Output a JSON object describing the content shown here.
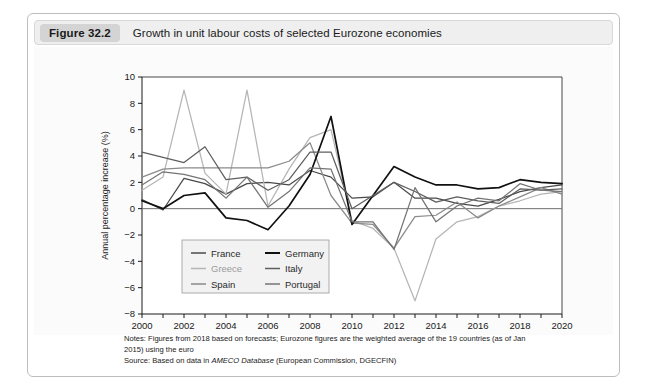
{
  "figure": {
    "number": "Figure 32.2",
    "title": "Growth in unit labour costs of selected Eurozone economies"
  },
  "notes": {
    "line1": "Notes: Figures from 2018 based on forecasts; Eurozone figures are the weighted average of the 19 countries (as of Jan",
    "line2": "2015) using the euro",
    "source_prefix": "Source: Based on data in ",
    "source_italic": "AMECO Database",
    "source_suffix": " (European Commission, DGECFIN)"
  },
  "chart_data": {
    "type": "line",
    "title": "Growth in unit labour costs of selected Eurozone economies",
    "xlabel": "",
    "ylabel": "Annual percentage increase (%)",
    "xlim": [
      2000,
      2020
    ],
    "ylim": [
      -8,
      10
    ],
    "ytick_step": 2,
    "yticks": [
      -8,
      -6,
      -4,
      -2,
      0,
      2,
      4,
      6,
      8,
      10
    ],
    "xticks": [
      2000,
      2001,
      2002,
      2003,
      2004,
      2005,
      2006,
      2007,
      2008,
      2009,
      2010,
      2011,
      2012,
      2013,
      2014,
      2015,
      2016,
      2017,
      2018,
      2019,
      2020
    ],
    "xtick_labels": [
      "2000",
      "",
      "2002",
      "",
      "2004",
      "",
      "2006",
      "",
      "2008",
      "",
      "2010",
      "",
      "2012",
      "",
      "2014",
      "",
      "2016",
      "",
      "2018",
      "",
      "2020"
    ],
    "grid": false,
    "zero_line": true,
    "legend_position": "lower-left-inside",
    "x": [
      2000,
      2001,
      2002,
      2003,
      2004,
      2005,
      2006,
      2007,
      2008,
      2009,
      2010,
      2011,
      2012,
      2013,
      2014,
      2015,
      2016,
      2017,
      2018,
      2019,
      2020
    ],
    "series": [
      {
        "name": "France",
        "color": "#4a4a4a",
        "values": [
          0.7,
          -0.1,
          2.3,
          1.9,
          1.1,
          1.9,
          2.0,
          1.8,
          2.9,
          2.4,
          0.8,
          0.9,
          2.0,
          0.8,
          0.8,
          0.4,
          0.2,
          0.7,
          1.3,
          1.6,
          1.8
        ]
      },
      {
        "name": "Greece",
        "color": "#b5b5b5",
        "values": [
          1.4,
          2.4,
          9.0,
          2.7,
          1.1,
          9.0,
          0.2,
          3.0,
          5.4,
          6.0,
          -0.9,
          -1.5,
          -3.0,
          -7.0,
          -2.3,
          -1.0,
          -0.6,
          0.2,
          0.6,
          1.1,
          1.3
        ]
      },
      {
        "name": "Spain",
        "color": "#8a8a8a",
        "values": [
          2.4,
          3.0,
          3.1,
          3.1,
          3.1,
          3.1,
          3.1,
          3.6,
          5.0,
          1.0,
          -1.1,
          -1.2,
          -3.0,
          -0.6,
          -0.5,
          0.5,
          -0.7,
          0.2,
          0.9,
          1.6,
          1.1
        ]
      },
      {
        "name": "Germany",
        "color": "#111111",
        "values": [
          0.6,
          0.0,
          1.0,
          1.2,
          -0.7,
          -0.9,
          -1.6,
          0.2,
          2.6,
          7.0,
          -1.2,
          1.0,
          3.2,
          2.4,
          1.8,
          1.8,
          1.5,
          1.6,
          2.2,
          2.0,
          1.9
        ]
      },
      {
        "name": "Italy",
        "color": "#5e5e5e",
        "values": [
          4.3,
          3.9,
          3.5,
          4.7,
          2.2,
          2.4,
          1.4,
          2.2,
          4.3,
          4.3,
          0.0,
          1.0,
          2.0,
          1.3,
          0.5,
          0.9,
          0.6,
          0.4,
          1.5,
          1.4,
          1.5
        ]
      },
      {
        "name": "Portugal",
        "color": "#747474",
        "values": [
          1.8,
          2.8,
          2.6,
          2.2,
          0.8,
          2.4,
          0.1,
          1.3,
          3.1,
          3.0,
          -1.0,
          -1.0,
          -3.1,
          1.6,
          -1.0,
          0.2,
          0.8,
          0.6,
          1.9,
          1.4,
          1.3
        ]
      }
    ]
  },
  "legend": {
    "entries": [
      {
        "label": "France",
        "color": "#4a4a4a"
      },
      {
        "label": "Germany",
        "color": "#111111"
      },
      {
        "label": "Greece",
        "color": "#b5b5b5"
      },
      {
        "label": "Italy",
        "color": "#5e5e5e"
      },
      {
        "label": "Spain",
        "color": "#8a8a8a"
      },
      {
        "label": "Portugal",
        "color": "#747474"
      }
    ]
  }
}
